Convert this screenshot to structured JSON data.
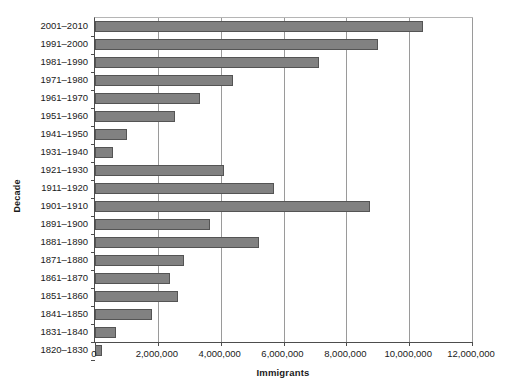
{
  "chart_data": {
    "type": "bar",
    "orientation": "horizontal",
    "title": "",
    "xlabel": "Immigrants",
    "ylabel": "Decade",
    "categories": [
      "2001–2010",
      "1991–2000",
      "1981–1990",
      "1971–1980",
      "1961–1970",
      "1951–1960",
      "1941–1950",
      "1931–1940",
      "1921–1930",
      "1911–1920",
      "1901–1910",
      "1891–1900",
      "1881–1890",
      "1871–1880",
      "1861–1870",
      "1851–1860",
      "1841–1850",
      "1831–1840",
      "1820–1830"
    ],
    "values": [
      10450000,
      9000000,
      7140000,
      4380000,
      3340000,
      2550000,
      1030000,
      560000,
      4100000,
      5700000,
      8750000,
      3650000,
      5230000,
      2840000,
      2390000,
      2650000,
      1800000,
      660000,
      210000
    ],
    "xlim": [
      0,
      12000000
    ],
    "xticks": [
      0,
      2000000,
      4000000,
      6000000,
      8000000,
      10000000,
      12000000
    ],
    "xtick_labels": [
      "0",
      "2,000,000",
      "4,000,000",
      "6,000,000",
      "8,000,000",
      "10,000,000",
      "12,000,000"
    ],
    "grid": "vertical",
    "legend": "none",
    "bar_color": "#818181",
    "bar_edge_color": "#545454",
    "gridline_color": "#9a9a9a",
    "axis_color": "#4d4d4d",
    "background": "#ffffff"
  }
}
